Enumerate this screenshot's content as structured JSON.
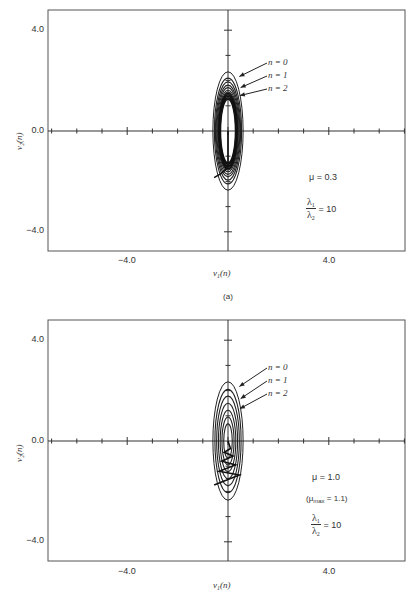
{
  "chart_data": [
    {
      "type": "line",
      "panel": "(a)",
      "title": "",
      "xlabel": "v1(n)",
      "ylabel": "v2(n)",
      "xlim": [
        -7.0,
        7.0
      ],
      "ylim": [
        -4.8,
        4.8
      ],
      "xticks": [
        -4.0,
        0.0,
        4.0
      ],
      "yticks": [
        4.0,
        0.0,
        -4.0
      ],
      "minor_tick_step": 1.0,
      "grid": false,
      "curves": "concentric error-surface contour ellipses centered at origin with weight-error trajectory",
      "contours": [
        {
          "rx": 0.6,
          "ry": 2.35
        },
        {
          "rx": 0.54,
          "ry": 2.1
        },
        {
          "rx": 0.5,
          "ry": 1.95
        },
        {
          "rx": 0.47,
          "ry": 1.82
        },
        {
          "rx": 0.44,
          "ry": 1.72
        },
        {
          "rx": 0.41,
          "ry": 1.62
        },
        {
          "rx": 0.39,
          "ry": 1.55
        }
      ],
      "trajectory": [
        [
          -0.55,
          -1.85
        ],
        [
          -0.3,
          -1.7
        ],
        [
          -0.1,
          -1.55
        ],
        [
          0.0,
          -1.4
        ],
        [
          0.0,
          0.0
        ]
      ],
      "annotations": [
        {
          "text": "n = 0",
          "x": 1.9,
          "y": 2.8
        },
        {
          "text": "n = 1",
          "x": 1.9,
          "y": 2.35
        },
        {
          "text": "n = 2",
          "x": 1.9,
          "y": 1.85
        },
        {
          "text": "μ = 0.3",
          "x": 3.0,
          "y": -1.6
        },
        {
          "text": "λ1/λ2 = 10",
          "x": 3.0,
          "y": -2.6
        }
      ]
    },
    {
      "type": "line",
      "panel": "(b)",
      "title": "",
      "xlabel": "v1(n)",
      "ylabel": "v2(n)",
      "xlim": [
        -7.0,
        7.0
      ],
      "ylim": [
        -4.8,
        4.8
      ],
      "xticks": [
        -4.0,
        0.0,
        4.0
      ],
      "yticks": [
        4.0,
        0.0,
        -4.0
      ],
      "minor_tick_step": 1.0,
      "grid": false,
      "curves": "concentric error-surface contour ellipses centered at origin with zigzag weight-error trajectory",
      "contours": [
        {
          "rx": 0.6,
          "ry": 2.35
        },
        {
          "rx": 0.52,
          "ry": 2.05
        },
        {
          "rx": 0.45,
          "ry": 1.78
        },
        {
          "rx": 0.38,
          "ry": 1.5
        },
        {
          "rx": 0.31,
          "ry": 1.22
        },
        {
          "rx": 0.24,
          "ry": 0.95
        },
        {
          "rx": 0.17,
          "ry": 0.68
        }
      ],
      "trajectory": [
        [
          -0.55,
          -1.75
        ],
        [
          0.45,
          -1.35
        ],
        [
          -0.35,
          -1.2
        ],
        [
          0.3,
          -0.95
        ],
        [
          -0.25,
          -0.8
        ],
        [
          0.2,
          -0.6
        ],
        [
          -0.15,
          -0.45
        ],
        [
          0.1,
          -0.3
        ],
        [
          0.0,
          0.0
        ]
      ],
      "annotations": [
        {
          "text": "n = 0",
          "x": 1.9,
          "y": 2.8
        },
        {
          "text": "n = 1",
          "x": 1.9,
          "y": 2.35
        },
        {
          "text": "n = 2",
          "x": 1.9,
          "y": 1.85
        },
        {
          "text": "μ = 1.0",
          "x": 3.0,
          "y": -1.3
        },
        {
          "text": "(μmax = 1.1)",
          "x": 3.0,
          "y": -2.0
        },
        {
          "text": "λ1/λ2 = 10",
          "x": 3.0,
          "y": -2.9
        }
      ]
    }
  ],
  "panel_a": {
    "caption": "(a)",
    "ytick_labels": [
      "4.0",
      "0.0",
      "−4.0"
    ],
    "xtick_labels": [
      "−4.0",
      "4.0"
    ],
    "x_zero_label": "",
    "xlabel_main": "ν",
    "xlabel_sub": "1",
    "xlabel_tail": "(n)",
    "ylabel_text": "ν₂(n)",
    "n_labels": [
      "n = 0",
      "n = 1",
      "n = 2"
    ],
    "mu_text": "μ = 0.3",
    "ratio_num": "λ",
    "ratio_num_sub": "1",
    "ratio_den": "λ",
    "ratio_den_sub": "2",
    "ratio_value": "= 10"
  },
  "panel_b": {
    "caption": "",
    "ytick_labels": [
      "4.0",
      "0.0",
      "−4.0"
    ],
    "xtick_labels": [
      "−4.0",
      "4.0"
    ],
    "xlabel_main": "ν",
    "xlabel_sub": "1",
    "xlabel_tail": "(n)",
    "ylabel_text": "ν₂(n)",
    "n_labels": [
      "n = 0",
      "n = 1",
      "n = 2"
    ],
    "mu_text": "μ = 1.0",
    "mu_max_open": "(μ",
    "mu_max_sub": "max",
    "mu_max_close": " = 1.1)",
    "ratio_num": "λ",
    "ratio_num_sub": "1",
    "ratio_den": "λ",
    "ratio_den_sub": "2",
    "ratio_value": "= 10"
  }
}
